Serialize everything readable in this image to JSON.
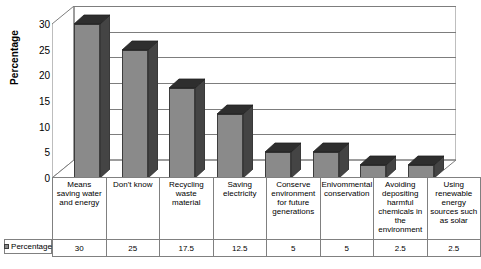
{
  "chart_data": {
    "type": "bar",
    "title": "",
    "subtitle": "",
    "xlabel": "",
    "ylabel": "Percentage",
    "ylim": [
      0,
      30
    ],
    "yticks": [
      0,
      5,
      10,
      15,
      20,
      25,
      30
    ],
    "grid": true,
    "legend_position": "table-left",
    "three_d": true,
    "categories": [
      "Means saving water and energy",
      "Don't know",
      "Recycling waste material",
      "Saving electricity",
      "Conserve environment for future generations",
      "Enivommental conservation",
      "Avoiding depositing harmful chemicals in the environment",
      "Using renewable energy sources such as solar"
    ],
    "category_lines": [
      [
        "Means",
        "saving water",
        "and energy"
      ],
      [
        "Don't know"
      ],
      [
        "Recycling",
        "waste",
        "material"
      ],
      [
        "Saving",
        "electricity"
      ],
      [
        "Conserve",
        "environment",
        "for future",
        "generations"
      ],
      [
        "Enivommental",
        "conservation"
      ],
      [
        "Avoiding",
        "depositing",
        "harmful",
        "chemicals in",
        "the",
        "environment"
      ],
      [
        "Using",
        "renewable",
        "energy",
        "sources such",
        "as solar"
      ]
    ],
    "series": [
      {
        "name": "Percentage",
        "values": [
          30,
          25,
          17.5,
          12.5,
          5,
          5,
          2.5,
          2.5
        ],
        "value_labels": [
          "30",
          "25",
          "17.5",
          "12.5",
          "5",
          "5",
          "2.5",
          "2.5"
        ],
        "color": "#8a8a8a"
      }
    ]
  },
  "legend": {
    "label": "Percentage",
    "swatch_color": "#8a8a8a"
  },
  "colors": {
    "bar_face": "#8a8a8a",
    "bar_side": "#444444",
    "bar_top": "#2e2e2e",
    "gridline": "#7d7d7d",
    "table_border": "#808080",
    "background": "#ffffff"
  }
}
